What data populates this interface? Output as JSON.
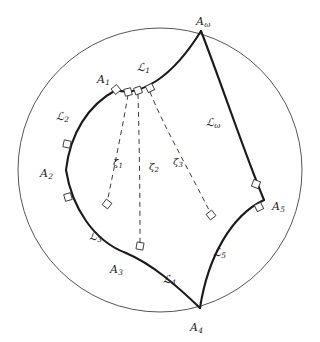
{
  "figure": {
    "type": "hyperbolic-geometry-diagram",
    "model": "poincare-disk",
    "background_color": "#ffffff",
    "ink_color": "#1a1a1a",
    "boundary_color": "#555555",
    "disk": {
      "cx": 160,
      "cy": 170,
      "r": 142
    },
    "vertices": [
      {
        "id": "A1",
        "base": "A",
        "sub": "1",
        "label_x": 97,
        "label_y": 70,
        "px": 116,
        "py": 90
      },
      {
        "id": "A2",
        "base": "A",
        "sub": "2",
        "label_x": 40,
        "label_y": 164,
        "px": 66,
        "py": 170
      },
      {
        "id": "A3",
        "base": "A",
        "sub": "3",
        "label_x": 110,
        "label_y": 260,
        "px": 126,
        "py": 253
      },
      {
        "id": "A4",
        "base": "A",
        "sub": "4",
        "label_x": 190,
        "label_y": 318,
        "px": 200,
        "py": 308
      },
      {
        "id": "A5",
        "base": "A",
        "sub": "5",
        "label_x": 272,
        "label_y": 197,
        "px": 264,
        "py": 200
      },
      {
        "id": "Aomega",
        "base": "A",
        "sub": "ω",
        "label_x": 196,
        "label_y": 12,
        "px": 201,
        "py": 31
      }
    ],
    "sides": [
      {
        "id": "L1",
        "base": "ℒ",
        "sub": "1",
        "label_x": 137,
        "label_y": 58
      },
      {
        "id": "L2",
        "base": "ℒ",
        "sub": "2",
        "label_x": 56,
        "label_y": 107
      },
      {
        "id": "L3",
        "base": "ℒ",
        "sub": "3",
        "label_x": 89,
        "label_y": 227
      },
      {
        "id": "L4",
        "base": "ℒ",
        "sub": "4",
        "label_x": 163,
        "label_y": 270
      },
      {
        "id": "L5",
        "base": "ℒ",
        "sub": "5",
        "label_x": 213,
        "label_y": 243
      },
      {
        "id": "Lomega",
        "base": "ℒ",
        "sub": "ω",
        "label_x": 206,
        "label_y": 113
      }
    ],
    "geodesics": [
      {
        "id": "zeta1",
        "base": "ζ",
        "sub": "1",
        "label_x": 113,
        "label_y": 153
      },
      {
        "id": "zeta2",
        "base": "ζ",
        "sub": "2",
        "label_x": 149,
        "label_y": 157
      },
      {
        "id": "zeta3",
        "base": "ζ",
        "sub": "3",
        "label_x": 173,
        "label_y": 152
      }
    ]
  }
}
